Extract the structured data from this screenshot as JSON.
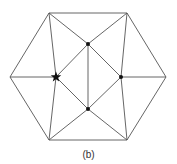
{
  "figure": {
    "caption": "(b)",
    "line_color": "#555555",
    "node_color": "#111111"
  },
  "nodes": [
    {
      "id": "TL",
      "x": 49,
      "y": 13,
      "type": "vertex"
    },
    {
      "id": "TR",
      "x": 127,
      "y": 13,
      "type": "vertex"
    },
    {
      "id": "R",
      "x": 166,
      "y": 77,
      "type": "vertex"
    },
    {
      "id": "BR",
      "x": 127,
      "y": 140,
      "type": "vertex"
    },
    {
      "id": "BL",
      "x": 49,
      "y": 140,
      "type": "vertex"
    },
    {
      "id": "L",
      "x": 10,
      "y": 77,
      "type": "vertex"
    },
    {
      "id": "STAR",
      "x": 56,
      "y": 77,
      "type": "star"
    },
    {
      "id": "TOP",
      "x": 88,
      "y": 44,
      "type": "dot"
    },
    {
      "id": "RIGHT",
      "x": 121,
      "y": 77,
      "type": "dot"
    },
    {
      "id": "BOT",
      "x": 88,
      "y": 109,
      "type": "dot"
    }
  ],
  "edges": [
    [
      "TL",
      "TR"
    ],
    [
      "TR",
      "R"
    ],
    [
      "R",
      "BR"
    ],
    [
      "BR",
      "BL"
    ],
    [
      "BL",
      "L"
    ],
    [
      "L",
      "TL"
    ],
    [
      "L",
      "STAR"
    ],
    [
      "TL",
      "STAR"
    ],
    [
      "BL",
      "STAR"
    ],
    [
      "TL",
      "TOP"
    ],
    [
      "TR",
      "TOP"
    ],
    [
      "STAR",
      "TOP"
    ],
    [
      "STAR",
      "BOT"
    ],
    [
      "TOP",
      "BOT"
    ],
    [
      "TOP",
      "RIGHT"
    ],
    [
      "BOT",
      "RIGHT"
    ],
    [
      "TR",
      "RIGHT"
    ],
    [
      "BR",
      "RIGHT"
    ],
    [
      "RIGHT",
      "R"
    ],
    [
      "BL",
      "BOT"
    ],
    [
      "BR",
      "BOT"
    ]
  ]
}
